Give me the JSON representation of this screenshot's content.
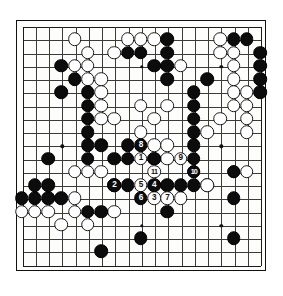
{
  "diagram": {
    "kind": "go-board-diagram",
    "board_size": 19,
    "colors": {
      "black_stone": "#0c0c0c",
      "white_stone": "#ffffff",
      "grid_line": "#3b3b3b",
      "board_background": "#fdfdfb",
      "border": "#111111"
    },
    "star_points": [
      [
        3,
        3
      ],
      [
        9,
        3
      ],
      [
        15,
        3
      ],
      [
        3,
        9
      ],
      [
        9,
        9
      ],
      [
        15,
        9
      ],
      [
        3,
        15
      ],
      [
        9,
        15
      ],
      [
        15,
        15
      ]
    ],
    "black_stones": [
      [
        11,
        1
      ],
      [
        16,
        1
      ],
      [
        17,
        1
      ],
      [
        8,
        2
      ],
      [
        9,
        2
      ],
      [
        11,
        2
      ],
      [
        18,
        2
      ],
      [
        3,
        3
      ],
      [
        10,
        3
      ],
      [
        11,
        3
      ],
      [
        18,
        3
      ],
      [
        4,
        4
      ],
      [
        11,
        4
      ],
      [
        14,
        4
      ],
      [
        18,
        4
      ],
      [
        3,
        5
      ],
      [
        5,
        5
      ],
      [
        13,
        5
      ],
      [
        18,
        5
      ],
      [
        5,
        6
      ],
      [
        13,
        6
      ],
      [
        5,
        7
      ],
      [
        13,
        7
      ],
      [
        5,
        8
      ],
      [
        13,
        8
      ],
      [
        5,
        9
      ],
      [
        6,
        9
      ],
      [
        8,
        9
      ],
      [
        13,
        9
      ],
      [
        2,
        10
      ],
      [
        5,
        10
      ],
      [
        7,
        10
      ],
      [
        8,
        10
      ],
      [
        10,
        10
      ],
      [
        13,
        10
      ],
      [
        13,
        11
      ],
      [
        16,
        11
      ],
      [
        1,
        12
      ],
      [
        2,
        12
      ],
      [
        7,
        12
      ],
      [
        8,
        12
      ],
      [
        11,
        12
      ],
      [
        12,
        12
      ],
      [
        13,
        12
      ],
      [
        0,
        13
      ],
      [
        1,
        13
      ],
      [
        2,
        13
      ],
      [
        3,
        13
      ],
      [
        16,
        13
      ],
      [
        5,
        14
      ],
      [
        6,
        14
      ],
      [
        11,
        14
      ],
      [
        9,
        16
      ],
      [
        16,
        16
      ],
      [
        6,
        17
      ]
    ],
    "white_stones": [
      [
        4,
        1
      ],
      [
        8,
        1
      ],
      [
        9,
        1
      ],
      [
        10,
        1
      ],
      [
        15,
        1
      ],
      [
        5,
        2
      ],
      [
        7,
        2
      ],
      [
        15,
        2
      ],
      [
        16,
        2
      ],
      [
        4,
        3
      ],
      [
        5,
        3
      ],
      [
        12,
        3
      ],
      [
        16,
        3
      ],
      [
        5,
        4
      ],
      [
        6,
        4
      ],
      [
        16,
        4
      ],
      [
        6,
        5
      ],
      [
        16,
        5
      ],
      [
        17,
        5
      ],
      [
        6,
        6
      ],
      [
        9,
        6
      ],
      [
        11,
        6
      ],
      [
        16,
        6
      ],
      [
        17,
        6
      ],
      [
        6,
        7
      ],
      [
        7,
        7
      ],
      [
        15,
        7
      ],
      [
        17,
        7
      ],
      [
        10,
        7
      ],
      [
        9,
        8
      ],
      [
        14,
        8
      ],
      [
        17,
        8
      ],
      [
        4,
        11
      ],
      [
        5,
        11
      ],
      [
        6,
        11
      ],
      [
        16,
        11
      ],
      [
        17,
        11
      ],
      [
        14,
        12
      ],
      [
        4,
        13
      ],
      [
        0,
        14
      ],
      [
        1,
        14
      ],
      [
        2,
        14
      ],
      [
        4,
        14
      ],
      [
        7,
        14
      ],
      [
        3,
        15
      ],
      [
        5,
        15
      ]
    ],
    "numbered_moves": [
      {
        "n": "1",
        "color": "white",
        "col": 9,
        "row": 10
      },
      {
        "n": "2",
        "color": "black",
        "col": 7,
        "row": 12
      },
      {
        "n": "3",
        "color": "white",
        "col": 10,
        "row": 13
      },
      {
        "n": "4",
        "color": "black",
        "col": 10,
        "row": 12
      },
      {
        "n": "5",
        "color": "white",
        "col": 9,
        "row": 12
      },
      {
        "n": "6",
        "color": "black",
        "col": 9,
        "row": 13
      },
      {
        "n": "7",
        "color": "white",
        "col": 11,
        "row": 13
      },
      {
        "n": "8",
        "color": "black",
        "col": 9,
        "row": 9
      },
      {
        "n": "9",
        "color": "white",
        "col": 12,
        "row": 10
      },
      {
        "n": "10",
        "color": "black",
        "col": 13,
        "row": 11
      },
      {
        "n": "11",
        "color": "white",
        "col": 10,
        "row": 11
      }
    ],
    "extra_white_after": [
      [
        10,
        9
      ],
      [
        11,
        9
      ],
      [
        10,
        10
      ],
      [
        11,
        10
      ],
      [
        12,
        13
      ],
      [
        14,
        12
      ]
    ]
  }
}
